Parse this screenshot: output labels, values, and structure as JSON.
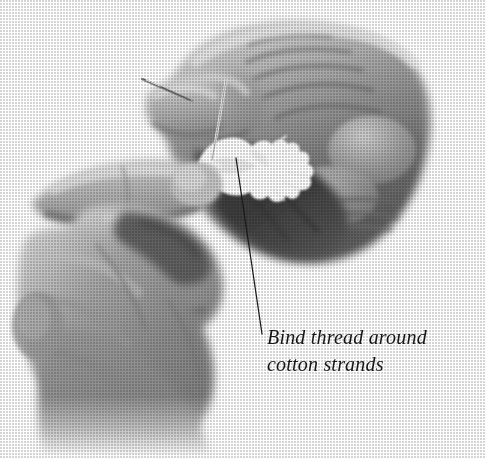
{
  "figure": {
    "type": "grayscale-halftone-photograph",
    "background_color": "#ffffff",
    "width": 486,
    "height": 458
  },
  "caption": {
    "line1": "Bind thread around",
    "line2": "cotton strands",
    "full_text": "Bind thread around cotton strands",
    "color": "#161616",
    "style": "italic-serif"
  },
  "leader_line": {
    "color": "#1b1b1b",
    "from_x": 262,
    "from_y": 334,
    "to_x": 236,
    "to_y": 158,
    "points_at": "cotton-strands"
  },
  "objects": {
    "right_hand_label": "right hand holding thread",
    "left_hand_label": "left hand pinching cotton",
    "needle_label": "sewing needle",
    "thread_label": "thread strand",
    "cotton_label": "white cotton strands tuft"
  },
  "palette": {
    "paper": "#ffffff",
    "skin_light": "#d8d8d8",
    "skin_mid": "#8f8f8f",
    "skin_dark": "#6a6a6a",
    "shadow_deep": "#3f3f3f",
    "shadow_core": "#2e2e2e",
    "cotton_white": "#fbfbfb",
    "ink": "#161616"
  }
}
